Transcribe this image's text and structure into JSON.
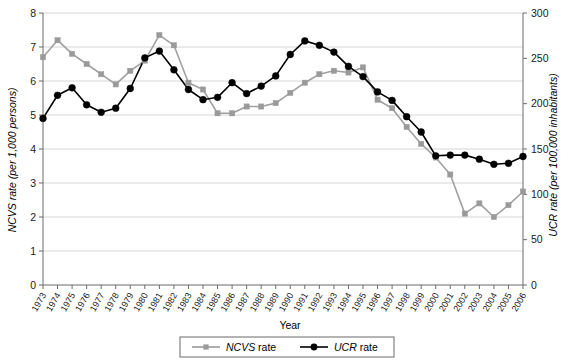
{
  "chart_data": {
    "type": "line",
    "title": "",
    "xlabel": "Year",
    "ylabel": "NCVS rate  (per 1,000 persons)",
    "y2label": "UCR rate  (per 100,000 inhabitants)",
    "ylim": [
      0,
      8
    ],
    "y2lim": [
      0,
      300
    ],
    "yticks": [
      0,
      1,
      2,
      3,
      4,
      5,
      6,
      7,
      8
    ],
    "y2ticks": [
      0,
      50,
      100,
      150,
      200,
      250,
      300
    ],
    "grid": true,
    "legend_position": "bottom",
    "categories": [
      "1973",
      "1974",
      "1975",
      "1976",
      "1977",
      "1978",
      "1979",
      "1980",
      "1981",
      "1982",
      "1983",
      "1984",
      "1985",
      "1986",
      "1987",
      "1988",
      "1989",
      "1990",
      "1991",
      "1992",
      "1993",
      "1994",
      "1995",
      "1996",
      "1997",
      "1998",
      "1999",
      "2000",
      "2001",
      "2002",
      "2003",
      "2004",
      "2005",
      "2006"
    ],
    "series": [
      {
        "name": "NCVS rate",
        "axis": "left",
        "units": "per 1,000 persons",
        "color": "#9a9a9a",
        "marker": "square",
        "values": [
          6.7,
          7.2,
          6.8,
          6.5,
          6.2,
          5.9,
          6.3,
          6.6,
          7.35,
          7.05,
          5.95,
          5.75,
          5.05,
          5.05,
          5.25,
          5.25,
          5.35,
          5.65,
          5.95,
          6.2,
          6.3,
          6.25,
          6.4,
          5.45,
          5.2,
          4.65,
          4.15,
          3.75,
          3.25,
          2.1,
          2.4,
          2.0,
          2.35,
          2.75
        ]
      },
      {
        "name": "UCR rate",
        "axis": "right",
        "units": "per 100,000 inhabitants",
        "color": "#000000",
        "marker": "circle",
        "values": [
          4.9,
          5.58,
          5.8,
          5.3,
          5.08,
          5.2,
          5.78,
          6.68,
          6.88,
          6.33,
          5.75,
          5.45,
          5.52,
          5.95,
          5.63,
          5.85,
          6.15,
          6.78,
          7.18,
          7.05,
          6.85,
          6.43,
          6.13,
          5.68,
          5.43,
          4.95,
          4.5,
          3.8,
          3.82,
          3.82,
          3.7,
          3.55,
          3.58,
          3.78
        ]
      }
    ],
    "legend": [
      {
        "label_italic": "NCVS",
        "label_rest": " rate",
        "marker": "square",
        "color": "#9a9a9a"
      },
      {
        "label_italic": "UCR",
        "label_rest": " rate",
        "marker": "circle",
        "color": "#000000"
      }
    ]
  }
}
